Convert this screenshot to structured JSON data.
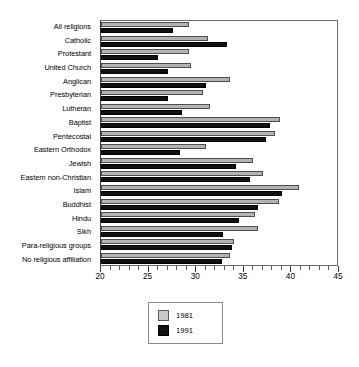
{
  "chart_data": {
    "type": "bar",
    "orientation": "horizontal",
    "title": "",
    "subtitle": "",
    "xlabel": "",
    "ylabel": "",
    "xlim": [
      20,
      45
    ],
    "xticks": [
      20,
      25,
      30,
      35,
      40,
      45
    ],
    "xtick_labels": [
      "20",
      "25",
      "30",
      "35",
      "40",
      "45"
    ],
    "minor_tick_step": 1,
    "grid": false,
    "legend_position": "bottom-center",
    "categories": [
      "All religions",
      "Catholic",
      "Protestant",
      "United Church",
      "Anglican",
      "Presbyterian",
      "Lutheran",
      "Baptist",
      "Pentecostal",
      "Eastern Orthodox",
      "Jewish",
      "Eastern non-Christian",
      "Islam",
      "Buddhist",
      "Hindu",
      "Sikh",
      "Para-religious groups",
      "No religious affiliation"
    ],
    "series": [
      {
        "name": "1981",
        "color": "#b3b3b3",
        "values": [
          29.2,
          31.2,
          29.2,
          29.5,
          33.5,
          30.7,
          31.5,
          38.8,
          38.3,
          31.0,
          36.0,
          37.0,
          40.8,
          38.7,
          36.2,
          36.5,
          34.0,
          33.5
        ]
      },
      {
        "name": "1991",
        "color": "#111111",
        "values": [
          27.6,
          33.2,
          26.0,
          27.0,
          31.0,
          27.0,
          28.5,
          37.8,
          37.3,
          28.3,
          34.2,
          35.7,
          39.0,
          36.5,
          34.5,
          32.8,
          33.8,
          32.7
        ]
      }
    ]
  },
  "legend": {
    "items": [
      {
        "label": "1981",
        "swatch": "light-gray-swatch"
      },
      {
        "label": "1991",
        "swatch": "black-swatch"
      }
    ]
  }
}
